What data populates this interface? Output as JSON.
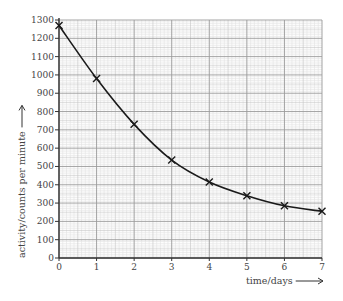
{
  "chart_data": {
    "type": "line",
    "title": "",
    "xlabel": "time/days",
    "ylabel": "activity/counts per minute",
    "x": [
      0,
      1,
      2,
      3,
      4,
      5,
      6,
      7
    ],
    "series": [
      {
        "name": "activity",
        "values": [
          1270,
          980,
          730,
          535,
          415,
          340,
          285,
          255
        ],
        "marker": "x",
        "smooth": true
      }
    ],
    "xlim": [
      0,
      7
    ],
    "ylim": [
      0,
      1300
    ],
    "xticks": [
      0,
      1,
      2,
      3,
      4,
      5,
      6,
      7
    ],
    "yticks": [
      0,
      100,
      200,
      300,
      400,
      500,
      600,
      700,
      800,
      900,
      1000,
      1100,
      1200,
      1300
    ],
    "grid": true,
    "legend": null
  },
  "colors": {
    "curve": "#1a1a1a",
    "marker": "#1a1a1a",
    "axis": "#333333",
    "grid_major": "#9a9a9a",
    "grid_mid": "#c4c4c4",
    "grid_minor": "#e2e2e2",
    "text": "#444444"
  }
}
